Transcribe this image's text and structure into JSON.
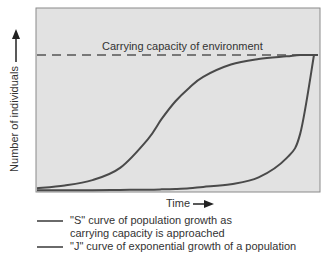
{
  "chart_data": {
    "type": "line",
    "title": "",
    "xlabel": "Time",
    "ylabel": "Number of individuals",
    "annotation": "Carrying capacity of environment",
    "carrying_capacity": 1.0,
    "x": [
      0,
      0.1,
      0.2,
      0.3,
      0.4,
      0.45,
      0.5,
      0.55,
      0.6,
      0.7,
      0.8,
      0.9,
      0.95,
      1.0
    ],
    "series": [
      {
        "name": "\"S\" curve of population growth as carrying capacity is approached",
        "values": [
          0.02,
          0.04,
          0.08,
          0.17,
          0.38,
          0.53,
          0.66,
          0.76,
          0.84,
          0.93,
          0.97,
          0.99,
          1.0,
          1.0
        ]
      },
      {
        "name": "\"J\" curve of exponential growth of a population",
        "values": [
          0.005,
          0.005,
          0.006,
          0.008,
          0.01,
          0.012,
          0.015,
          0.02,
          0.03,
          0.05,
          0.1,
          0.24,
          0.42,
          1.0
        ]
      }
    ],
    "xlim": [
      0,
      1
    ],
    "ylim": [
      0,
      1.15
    ],
    "grid": false,
    "legend_position": "bottom"
  },
  "labels": {
    "ylabel": "Number of individuals",
    "xlabel": "Time",
    "capacity": "Carrying capacity of environment",
    "legend_s": "\"S\" curve of population growth as carrying capacity is approached",
    "legend_j": "\"J\" curve of exponential growth of a population"
  },
  "colors": {
    "plot_bg": "#e2e2e2",
    "frame": "#8a8a8a",
    "curve": "#4a4a4a",
    "dash": "#555555"
  }
}
